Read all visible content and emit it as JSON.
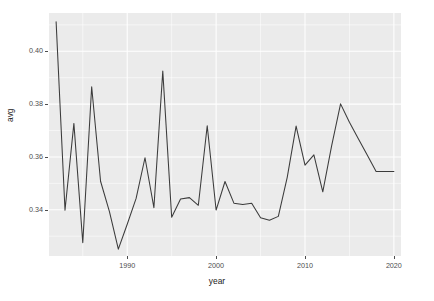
{
  "chart_data": {
    "type": "line",
    "title": "",
    "xlabel": "year",
    "ylabel": "avg",
    "xlim": [
      1981.2,
      2020.8
    ],
    "ylim": [
      0.3225,
      0.4145
    ],
    "grid": true,
    "legend": "none",
    "x_ticks": [
      1990,
      2000,
      2010,
      2020
    ],
    "x_tick_labels": [
      "1990",
      "2000",
      "2010",
      "2020"
    ],
    "y_ticks": [
      0.34,
      0.36,
      0.38,
      0.4
    ],
    "y_tick_labels": [
      "0.34",
      "0.36",
      "0.38",
      "0.40"
    ],
    "x": [
      1982,
      1983,
      1984,
      1985,
      1986,
      1987,
      1988,
      1989,
      1990,
      1991,
      1992,
      1993,
      1994,
      1995,
      1996,
      1997,
      1998,
      1999,
      2000,
      2001,
      2002,
      2003,
      2004,
      2005,
      2006,
      2007,
      2008,
      2009,
      2010,
      2011,
      2012,
      2013,
      2014,
      2015,
      2016,
      2017,
      2018,
      2019,
      2020
    ],
    "values": [
      0.4112,
      0.3398,
      0.3727,
      0.3275,
      0.3866,
      0.3508,
      0.3393,
      0.3251,
      0.3345,
      0.3443,
      0.3597,
      0.3408,
      0.3925,
      0.3372,
      0.3441,
      0.3446,
      0.3417,
      0.3718,
      0.3399,
      0.3507,
      0.3425,
      0.342,
      0.3425,
      0.337,
      0.336,
      0.3375,
      0.3523,
      0.3717,
      0.3569,
      0.3608,
      0.3468,
      0.3643,
      0.3801,
      0.3731,
      0.3669,
      0.3607,
      0.3545,
      0.3545,
      0.3545
    ],
    "series": [
      {
        "name": "avg",
        "color": "#3b3b3b",
        "values": [
          0.4112,
          0.3398,
          0.3727,
          0.3275,
          0.3866,
          0.3508,
          0.3393,
          0.3251,
          0.3345,
          0.3443,
          0.3597,
          0.3408,
          0.3925,
          0.3372,
          0.3441,
          0.3446,
          0.3417,
          0.3718,
          0.3399,
          0.3507,
          0.3425,
          0.342,
          0.3425,
          0.337,
          0.336,
          0.3375,
          0.3523,
          0.3717,
          0.3569,
          0.3608,
          0.3468,
          0.3643,
          0.3801,
          0.3731,
          0.3669,
          0.3607,
          0.3545,
          0.3545,
          0.3545
        ]
      }
    ]
  },
  "style": {
    "panel_background": "#ebebeb",
    "gridline_color": "#ffffff",
    "line_color": "#3b3b3b",
    "axis_text_color": "#4d4d4d",
    "axis_title_color": "#1a1a1a",
    "page_background": "#ffffff"
  }
}
